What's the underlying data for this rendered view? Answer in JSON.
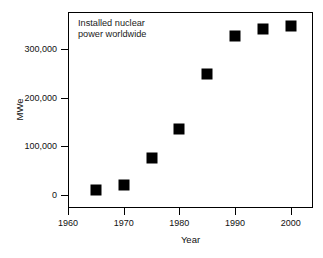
{
  "chart_data": {
    "type": "scatter",
    "title": "",
    "annotation": "Installed nuclear power worldwide",
    "annotation_lines": [
      "Installed nuclear",
      "power worldwide"
    ],
    "xlabel": "Year",
    "ylabel": "MWe",
    "xlim": [
      1960,
      2004
    ],
    "ylim": [
      -26000,
      375000
    ],
    "grid": false,
    "legend": null,
    "marker": "filled-square",
    "marker_color": "#000000",
    "x": [
      1965,
      1970,
      1975,
      1980,
      1985,
      1990,
      1995,
      2000
    ],
    "values": [
      10000,
      22000,
      76000,
      135000,
      248000,
      325000,
      341000,
      347000
    ],
    "xticks": [
      {
        "value": 1960,
        "label": "1960"
      },
      {
        "value": 1970,
        "label": "1970"
      },
      {
        "value": 1980,
        "label": "1980"
      },
      {
        "value": 1990,
        "label": "1990"
      },
      {
        "value": 2000,
        "label": "2000"
      }
    ],
    "yticks": [
      {
        "value": 0,
        "label": "0"
      },
      {
        "value": 100000,
        "label": "100,000"
      },
      {
        "value": 200000,
        "label": "200,000"
      },
      {
        "value": 300000,
        "label": "300,000"
      }
    ],
    "points": [
      {
        "x": 1965,
        "y": 10000
      },
      {
        "x": 1970,
        "y": 22000
      },
      {
        "x": 1975,
        "y": 76000
      },
      {
        "x": 1980,
        "y": 135000
      },
      {
        "x": 1985,
        "y": 248000
      },
      {
        "x": 1990,
        "y": 325000
      },
      {
        "x": 1995,
        "y": 341000
      },
      {
        "x": 2000,
        "y": 347000
      }
    ]
  },
  "colors": {
    "background": "#ffffff",
    "axis": "#000000",
    "marker": "#000000",
    "text": "#111111"
  }
}
